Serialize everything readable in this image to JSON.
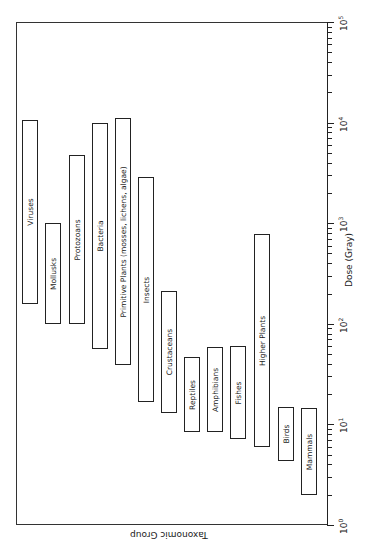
{
  "chart_data": {
    "type": "bar",
    "orientation": "range-bars, rotated 90 degrees (dose axis vertical on right, log scale)",
    "title": "",
    "xlabel": "Taxonomic Group",
    "ylabel": "Dose (Gray)",
    "yscale": "log",
    "ylim": [
      1,
      100000
    ],
    "tick_labels": [
      "10^0",
      "10^1",
      "10^2",
      "10^3",
      "10^4",
      "10^5"
    ],
    "grid": false,
    "categories": [
      "Viruses",
      "Mollusks",
      "Protozoans",
      "Bacteria",
      "Primitive Plants (mosses, lichens, algae)",
      "Insects",
      "Crustaceans",
      "Reptiles",
      "Amphibians",
      "Fishes",
      "Higher Plants",
      "Birds",
      "Mammals"
    ],
    "series": [
      {
        "name": "min_dose_gray",
        "values": [
          160,
          100,
          100,
          57,
          39,
          17,
          13,
          8.4,
          8.4,
          7.1,
          6,
          4.4,
          2
        ]
      },
      {
        "name": "max_dose_gray",
        "values": [
          10700,
          1000,
          4800,
          10000,
          11000,
          2900,
          210,
          47,
          59,
          60,
          780,
          15,
          14.5
        ]
      }
    ]
  },
  "axis": {
    "dose_label": "Dose (Gray)",
    "group_label": "Taxonomic Group",
    "ticks": [
      {
        "base": "10",
        "exp": "0"
      },
      {
        "base": "10",
        "exp": "1"
      },
      {
        "base": "10",
        "exp": "2"
      },
      {
        "base": "10",
        "exp": "3"
      },
      {
        "base": "10",
        "exp": "4"
      },
      {
        "base": "10",
        "exp": "5"
      }
    ]
  },
  "bars": [
    {
      "label": "Viruses",
      "x": 22
    },
    {
      "label": "Mollusks",
      "x": 45
    },
    {
      "label": "Protozoans",
      "x": 69
    },
    {
      "label": "Bacteria",
      "x": 92
    },
    {
      "label": "Primitive Plants (mosses, lichens, algae)",
      "x": 115
    },
    {
      "label": "Insects",
      "x": 138
    },
    {
      "label": "Crustaceans",
      "x": 161
    },
    {
      "label": "Reptiles",
      "x": 184
    },
    {
      "label": "Amphibians",
      "x": 207
    },
    {
      "label": "Fishes",
      "x": 230
    },
    {
      "label": "Higher Plants",
      "x": 254
    },
    {
      "label": "Birds",
      "x": 278
    },
    {
      "label": "Mammals",
      "x": 301
    }
  ]
}
